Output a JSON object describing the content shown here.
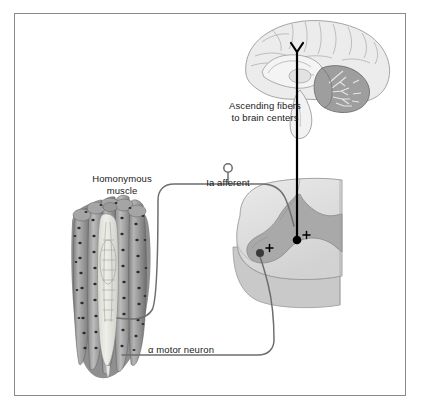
{
  "figure": {
    "background_color": "#ffffff",
    "frame_color": "#8a8a8a",
    "label_color": "#1a1a1a"
  },
  "labels": {
    "ascending_fibers": "Ascending fibers\nto brain centers",
    "homonymous_muscle": "Homonymous\nmuscle",
    "ia_afferent": "Ia afferent",
    "alpha_motor_neuron": "α motor neuron"
  },
  "synapses": [
    {
      "name": "dorsal-horn-synapse",
      "sign": "+"
    },
    {
      "name": "ventral-horn-synapse",
      "sign": "+"
    }
  ],
  "structures": {
    "brain": "mid-sagittal-brain-section",
    "cerebellum": "cerebellum",
    "brainstem": "brainstem",
    "spinal_cord": "spinal-cord-cross-section",
    "gray_matter": "spinal-gray-matter",
    "muscle": "skeletal-muscle-bundle",
    "muscle_spindle": "muscle-spindle",
    "ganglion_cell_body": "dorsal-root-ganglion-cell-body"
  },
  "colors": {
    "pathway_line": "#6b6b6b",
    "ascending_tract": "#000000",
    "gray_matter_fill": "#a8a8a8",
    "white_matter_fill": "#e0e0e0",
    "brain_fill": "#e8e8e8",
    "cerebellum_fill": "#9a9a9a",
    "muscle_fill": "#9b9b9b",
    "spindle_fill": "#e6e6e2"
  }
}
